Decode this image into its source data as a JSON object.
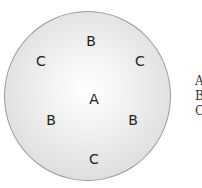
{
  "diagram": {
    "labels": [
      {
        "text": "B",
        "x": 91,
        "y": 41
      },
      {
        "text": "C",
        "x": 41,
        "y": 61
      },
      {
        "text": "C",
        "x": 140,
        "y": 61
      },
      {
        "text": "A",
        "x": 94,
        "y": 99
      },
      {
        "text": "B",
        "x": 51,
        "y": 120
      },
      {
        "text": "B",
        "x": 133,
        "y": 120
      },
      {
        "text": "C",
        "x": 94,
        "y": 159
      }
    ],
    "legend": [
      "A",
      "B",
      "C"
    ]
  }
}
